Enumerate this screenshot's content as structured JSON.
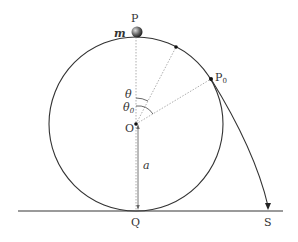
{
  "diagram": {
    "labels": {
      "P": "P",
      "m": "m",
      "P0": "P",
      "P0_sub": "0",
      "theta": "θ",
      "theta0": "θ",
      "theta0_sub": "0",
      "O": "O",
      "a": "a",
      "Q": "Q",
      "S": "S"
    },
    "geometry": {
      "center": [
        136,
        124
      ],
      "radius": 87,
      "ground_y": 211,
      "theta_deg": 26,
      "theta0_deg": 58
    },
    "colors": {
      "line": "#333333",
      "dotted": "#888888",
      "ground": "#999999",
      "ball": "#444444"
    }
  }
}
